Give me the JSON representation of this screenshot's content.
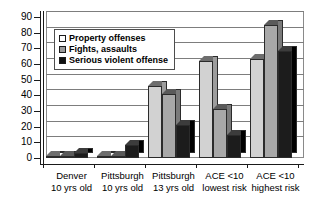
{
  "chart_data": {
    "type": "bar",
    "title": "",
    "xlabel": "",
    "ylabel": "",
    "ylim": [
      0,
      90
    ],
    "ytick_step": 10,
    "grid": true,
    "legend_position": "upper-left-inside",
    "categories": [
      "Denver\n10 yrs old",
      "Pittsburgh\n10 yrs old",
      "Pittsburgh\n13 yrs old",
      "ACE <10\nlowest risk",
      "ACE <10\nhighest risk"
    ],
    "category_lines": [
      {
        "line1": "Denver",
        "line2": "10 yrs old"
      },
      {
        "line1": "Pittsburgh",
        "line2": "10 yrs old"
      },
      {
        "line1": "Pittsburgh",
        "line2": "13 yrs old"
      },
      {
        "line1": "ACE <10",
        "line2": "lowest risk"
      },
      {
        "line1": "ACE <10",
        "line2": "highest risk"
      }
    ],
    "yticks": [
      0,
      10,
      20,
      30,
      40,
      50,
      60,
      70,
      80,
      90
    ],
    "series": [
      {
        "name": "Property offenses",
        "color": "#d2d2d2",
        "legend_swatch": "#ffffff",
        "values": [
          1,
          1,
          46,
          62,
          63
        ]
      },
      {
        "name": "Fights, assaults",
        "color": "#a8a8a8",
        "legend_swatch": "#9a9a9a",
        "values": [
          1,
          1,
          41,
          31,
          85
        ]
      },
      {
        "name": "Serious violent offense",
        "color": "#1c1c1c",
        "legend_swatch": "#101010",
        "values": [
          3,
          8,
          21,
          15,
          68
        ]
      }
    ]
  },
  "legend": {
    "items": [
      {
        "label": "Property offenses"
      },
      {
        "label": "Fights, assaults"
      },
      {
        "label": "Serious violent offense"
      }
    ]
  }
}
